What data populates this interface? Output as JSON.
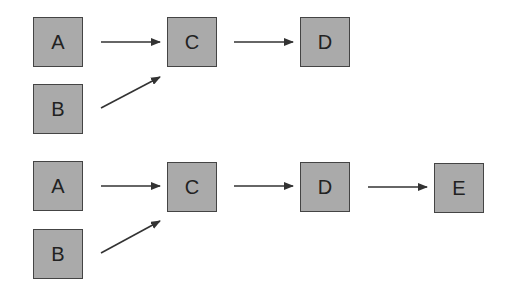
{
  "diagrams": [
    {
      "nodes": [
        {
          "id": "A",
          "label": "A"
        },
        {
          "id": "B",
          "label": "B"
        },
        {
          "id": "C",
          "label": "C"
        },
        {
          "id": "D",
          "label": "D"
        }
      ],
      "edges": [
        [
          "A",
          "C"
        ],
        [
          "B",
          "C"
        ],
        [
          "C",
          "D"
        ]
      ]
    },
    {
      "nodes": [
        {
          "id": "A",
          "label": "A"
        },
        {
          "id": "B",
          "label": "B"
        },
        {
          "id": "C",
          "label": "C"
        },
        {
          "id": "D",
          "label": "D"
        },
        {
          "id": "E",
          "label": "E"
        }
      ],
      "edges": [
        [
          "A",
          "C"
        ],
        [
          "B",
          "C"
        ],
        [
          "C",
          "D"
        ],
        [
          "D",
          "E"
        ]
      ]
    }
  ],
  "colors": {
    "node_fill": "#aaaaaa",
    "node_border": "#444444",
    "edge": "#333333"
  }
}
